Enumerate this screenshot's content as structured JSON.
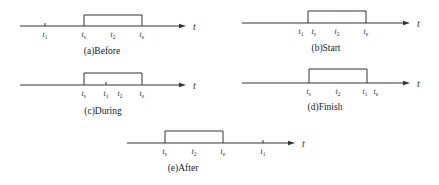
{
  "axis_symbol": "t",
  "panels": [
    {
      "id": "a",
      "caption": "(a)Before",
      "axis": {
        "x1": 20,
        "x2": 186,
        "y": 26
      },
      "box": {
        "x1": 84,
        "x2": 142,
        "top": 15
      },
      "labels": [
        {
          "base": "t",
          "sub": "1",
          "x": 45,
          "tick": true
        },
        {
          "base": "t",
          "sub": "s",
          "x": 84,
          "tick": false
        },
        {
          "base": "t",
          "sub": "2",
          "x": 113,
          "tick": false
        },
        {
          "base": "t",
          "sub": "e",
          "x": 142,
          "tick": false
        }
      ],
      "caption_x": 102,
      "caption_y": 54,
      "t_x": 193
    },
    {
      "id": "b",
      "caption": "(b)Start",
      "axis": {
        "x1": 242,
        "x2": 410,
        "y": 23
      },
      "box": {
        "x1": 308,
        "x2": 366,
        "top": 11
      },
      "labels": [
        {
          "base": "t",
          "sub": "1",
          "x": 301,
          "tick": false
        },
        {
          "base": "t",
          "sub": "s",
          "x": 314,
          "tick": false
        },
        {
          "base": "t",
          "sub": "2",
          "x": 337,
          "tick": false
        },
        {
          "base": "t",
          "sub": "e",
          "x": 366,
          "tick": false
        }
      ],
      "caption_x": 326,
      "caption_y": 51,
      "t_x": 417
    },
    {
      "id": "c",
      "caption": "(c)During",
      "axis": {
        "x1": 20,
        "x2": 186,
        "y": 85
      },
      "box": {
        "x1": 84,
        "x2": 142,
        "top": 73
      },
      "labels": [
        {
          "base": "t",
          "sub": "s",
          "x": 84,
          "tick": false
        },
        {
          "base": "t",
          "sub": "1",
          "x": 106,
          "tick": true
        },
        {
          "base": "t",
          "sub": "2",
          "x": 120,
          "tick": false
        },
        {
          "base": "t",
          "sub": "e",
          "x": 142,
          "tick": false
        }
      ],
      "caption_x": 103,
      "caption_y": 114,
      "t_x": 193
    },
    {
      "id": "d",
      "caption": "(d)Finish",
      "axis": {
        "x1": 242,
        "x2": 410,
        "y": 83
      },
      "box": {
        "x1": 309,
        "x2": 367,
        "top": 69
      },
      "labels": [
        {
          "base": "t",
          "sub": "s",
          "x": 309,
          "tick": false
        },
        {
          "base": "t",
          "sub": "2",
          "x": 338,
          "tick": false
        },
        {
          "base": "t",
          "sub": "1",
          "x": 365,
          "tick": false
        },
        {
          "base": "t",
          "sub": "e",
          "x": 376,
          "tick": false
        }
      ],
      "caption_x": 325,
      "caption_y": 110,
      "t_x": 417
    },
    {
      "id": "e",
      "caption": "(e)After",
      "axis": {
        "x1": 127,
        "x2": 295,
        "y": 143
      },
      "box": {
        "x1": 165,
        "x2": 223,
        "top": 131
      },
      "labels": [
        {
          "base": "t",
          "sub": "s",
          "x": 165,
          "tick": false
        },
        {
          "base": "t",
          "sub": "2",
          "x": 194,
          "tick": false
        },
        {
          "base": "t",
          "sub": "e",
          "x": 223,
          "tick": false
        },
        {
          "base": "t",
          "sub": "1",
          "x": 263,
          "tick": true
        }
      ],
      "caption_x": 183,
      "caption_y": 171,
      "t_x": 302
    }
  ]
}
